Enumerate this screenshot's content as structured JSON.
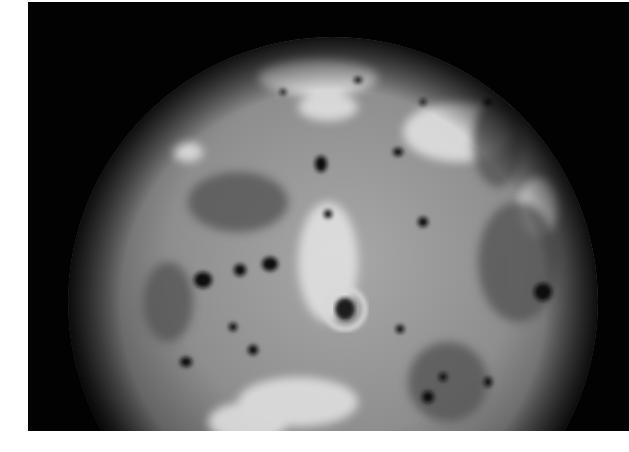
{
  "image": {
    "subject": "Io (volcanic moon) photograph",
    "background_color": "#020202",
    "page_color": "#ffffff",
    "surface_colors": {
      "base": "#8a8a8a",
      "bright": "#e6e6e6",
      "dark_spot": "#111111"
    }
  }
}
